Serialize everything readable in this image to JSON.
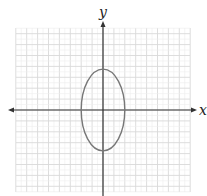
{
  "chart_data": {
    "type": "line",
    "title": "",
    "xlabel": "x",
    "ylabel": "y",
    "grid": true,
    "xlim": [
      -8,
      8
    ],
    "ylim": [
      -8,
      7.5
    ],
    "tick_labels": [],
    "legend": null,
    "series": [
      {
        "name": "ellipse",
        "shape": "ellipse",
        "center": [
          0,
          0
        ],
        "semi_axis_x": 2,
        "semi_axis_y": 3.75,
        "color": "#777777"
      }
    ]
  },
  "axes": {
    "x_label": "x",
    "y_label": "y"
  },
  "colors": {
    "grid": "#d9d9d9",
    "axis": "#333333",
    "curve": "#777777"
  }
}
